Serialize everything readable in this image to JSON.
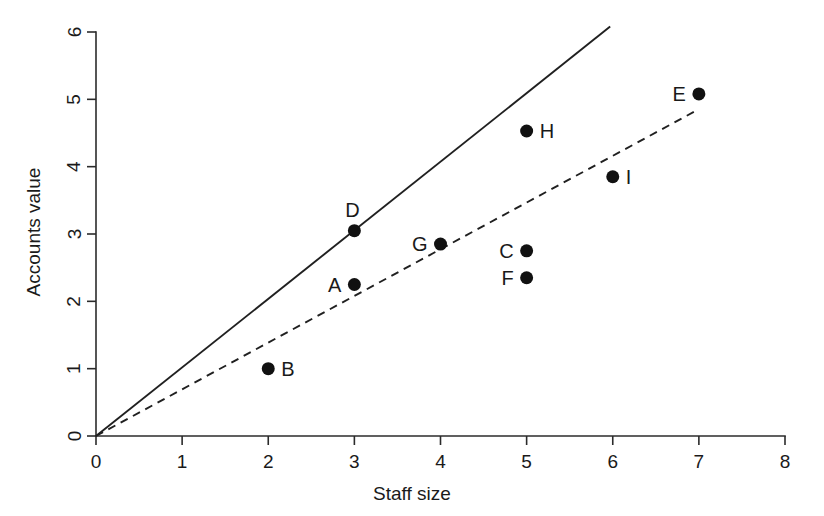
{
  "chart_data": {
    "type": "scatter",
    "title": "",
    "xlabel": "Staff size",
    "ylabel": "Accounts value",
    "xlim": [
      0,
      8
    ],
    "ylim": [
      0,
      6
    ],
    "xticks": [
      "0",
      "1",
      "2",
      "3",
      "4",
      "5",
      "6",
      "7",
      "8"
    ],
    "yticks": [
      "0",
      "1",
      "2",
      "3",
      "4",
      "5",
      "6"
    ],
    "grid": false,
    "legend": "none",
    "point_color": "#111111",
    "line_color": "#202020",
    "points": [
      {
        "label": "A",
        "x": 3,
        "y": 2.25,
        "label_side": "left"
      },
      {
        "label": "B",
        "x": 2,
        "y": 1.0,
        "label_side": "right"
      },
      {
        "label": "C",
        "x": 5,
        "y": 2.75,
        "label_side": "left"
      },
      {
        "label": "D",
        "x": 3,
        "y": 3.05,
        "label_side": "above"
      },
      {
        "label": "E",
        "x": 7,
        "y": 5.08,
        "label_side": "left"
      },
      {
        "label": "F",
        "x": 5,
        "y": 2.35,
        "label_side": "left"
      },
      {
        "label": "G",
        "x": 4,
        "y": 2.85,
        "label_side": "left"
      },
      {
        "label": "H",
        "x": 5,
        "y": 4.53,
        "label_side": "right"
      },
      {
        "label": "I",
        "x": 6,
        "y": 3.85,
        "label_side": "right"
      }
    ],
    "series": [
      {
        "name": "solid-reference-line",
        "style": "solid",
        "x": [
          0,
          5.97
        ],
        "y": [
          0,
          6.08
        ]
      },
      {
        "name": "dashed-reference-line",
        "style": "dashed",
        "x": [
          0,
          6.98
        ],
        "y": [
          0,
          4.84
        ]
      }
    ]
  }
}
